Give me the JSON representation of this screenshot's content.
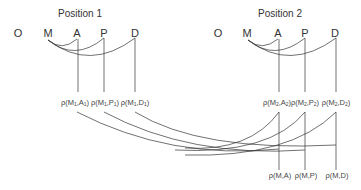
{
  "positions": [
    {
      "title": "Position 1",
      "nodes": [
        "O",
        "M",
        "A",
        "P",
        "D"
      ],
      "labels": [
        {
          "rho": "ρ",
          "open": "(M",
          "sub1": "1",
          "mid": ",A",
          "sub2": "1",
          "close": ")"
        },
        {
          "rho": "ρ",
          "open": "(M",
          "sub1": "1",
          "mid": ",P",
          "sub2": "1",
          "close": ")"
        },
        {
          "rho": "ρ",
          "open": "(M",
          "sub1": "1",
          "mid": ",D",
          "sub2": "1",
          "close": ")"
        }
      ]
    },
    {
      "title": "Position 2",
      "nodes": [
        "O",
        "M",
        "A",
        "P",
        "D"
      ],
      "labels": [
        {
          "rho": "ρ",
          "open": "(M",
          "sub1": "2",
          "mid": ",A",
          "sub2": "2",
          "close": ")"
        },
        {
          "rho": "ρ",
          "open": "(M",
          "sub1": "2",
          "mid": ",P",
          "sub2": "2",
          "close": ")"
        },
        {
          "rho": "ρ",
          "open": "(M",
          "sub1": "2",
          "mid": ",D",
          "sub2": "2",
          "close": ")"
        }
      ]
    }
  ],
  "combined": [
    "ρ(M,A)",
    "ρ(M,P)",
    "ρ(M,D)"
  ],
  "colors": {
    "line": "#333333",
    "text": "#333333"
  }
}
